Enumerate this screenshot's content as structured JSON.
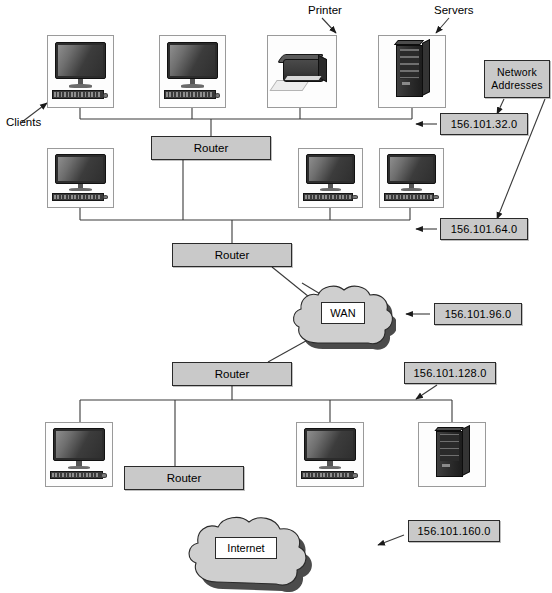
{
  "diagram": {
    "colors": {
      "box_fill": "#c9c9c9",
      "box_border": "#2a2a2a",
      "cloud_fill": "#cfcfcf",
      "cloud_border": "#2a2a2a",
      "device_frame": "#9a9a9a",
      "wire": "#3a3a3a",
      "background": "#ffffff"
    }
  },
  "callouts": {
    "clients": "Clients",
    "printer": "Printer",
    "servers": "Servers",
    "network_addresses_line1": "Network",
    "network_addresses_line2": "Addresses"
  },
  "routers": [
    {
      "id": "router-lan1",
      "label": "Router"
    },
    {
      "id": "router-lan2",
      "label": "Router"
    },
    {
      "id": "router-wan-uplink",
      "label": "Router"
    },
    {
      "id": "router-lan3",
      "label": "Router"
    },
    {
      "id": "router-edge",
      "label": "Router"
    }
  ],
  "clouds": [
    {
      "id": "wan-cloud",
      "label": "WAN"
    },
    {
      "id": "internet-cloud",
      "label": "Internet"
    }
  ],
  "addresses": [
    {
      "id": "addr-subnet-32",
      "value": "156.101.32.0"
    },
    {
      "id": "addr-subnet-64",
      "value": "156.101.64.0"
    },
    {
      "id": "addr-subnet-96",
      "value": "156.101.96.0"
    },
    {
      "id": "addr-subnet-128",
      "value": "156.101.128.0"
    },
    {
      "id": "addr-subnet-160",
      "value": "156.101.160.0"
    }
  ],
  "devices": [
    {
      "id": "client-1",
      "type": "computer",
      "segment": "156.101.32.0"
    },
    {
      "id": "client-2",
      "type": "computer",
      "segment": "156.101.32.0"
    },
    {
      "id": "printer-1",
      "type": "printer",
      "segment": "156.101.32.0"
    },
    {
      "id": "server-1",
      "type": "server",
      "segment": "156.101.32.0"
    },
    {
      "id": "client-3",
      "type": "computer",
      "segment": "156.101.64.0"
    },
    {
      "id": "client-4",
      "type": "computer",
      "segment": "156.101.64.0"
    },
    {
      "id": "client-5",
      "type": "computer",
      "segment": "156.101.64.0"
    },
    {
      "id": "client-6",
      "type": "computer",
      "segment": "156.101.128.0"
    },
    {
      "id": "client-7",
      "type": "computer",
      "segment": "156.101.128.0"
    },
    {
      "id": "server-2",
      "type": "server",
      "segment": "156.101.128.0"
    }
  ]
}
